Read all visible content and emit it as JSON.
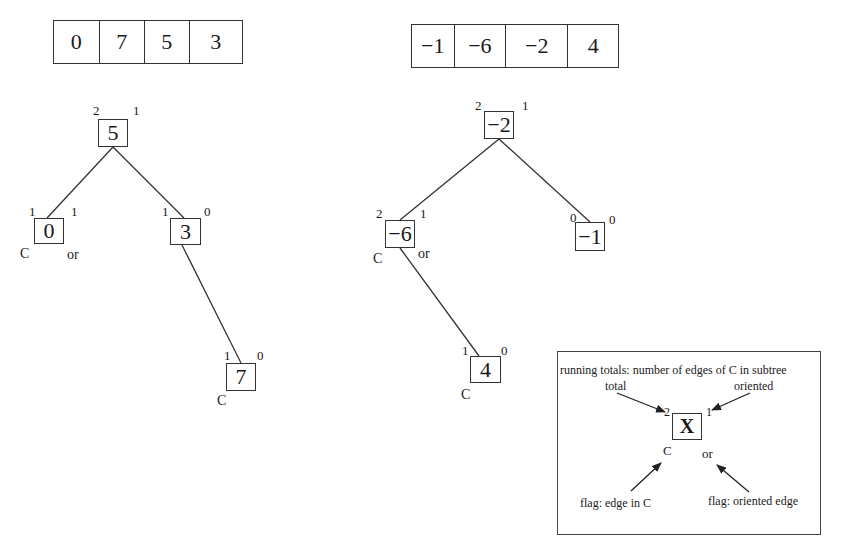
{
  "left": {
    "array": [
      "0",
      "7",
      "5",
      "3"
    ],
    "nodes": {
      "root": {
        "value": "5",
        "total": "2",
        "oriented": "1",
        "c_flag": "",
        "or_flag": ""
      },
      "left_child": {
        "value": "0",
        "total": "1",
        "oriented": "1",
        "c_flag": "C",
        "or_flag": "or"
      },
      "right_child": {
        "value": "3",
        "total": "1",
        "oriented": "0",
        "c_flag": "",
        "or_flag": ""
      },
      "grandchild": {
        "value": "7",
        "total": "1",
        "oriented": "0",
        "c_flag": "C",
        "or_flag": ""
      }
    }
  },
  "right": {
    "array": [
      "−1",
      "−6",
      "−2",
      "4"
    ],
    "nodes": {
      "root": {
        "value": "−2",
        "total": "2",
        "oriented": "1",
        "c_flag": "",
        "or_flag": ""
      },
      "left_child": {
        "value": "−6",
        "total": "2",
        "oriented": "1",
        "c_flag": "C",
        "or_flag": "or"
      },
      "right_child": {
        "value": "−1",
        "total": "0",
        "oriented": "0",
        "c_flag": "",
        "or_flag": ""
      },
      "grandchild": {
        "value": "4",
        "total": "1",
        "oriented": "0",
        "c_flag": "C",
        "or_flag": ""
      }
    }
  },
  "legend": {
    "title": "running totals: number of edges of C in subtree",
    "total_label": "total",
    "oriented_label": "oriented",
    "node_value": "X",
    "total_value": "2",
    "oriented_value": "1",
    "c_flag": "C",
    "or_flag": "or",
    "flag_c_label": "flag: edge in C",
    "flag_or_label": "flag: oriented edge"
  }
}
